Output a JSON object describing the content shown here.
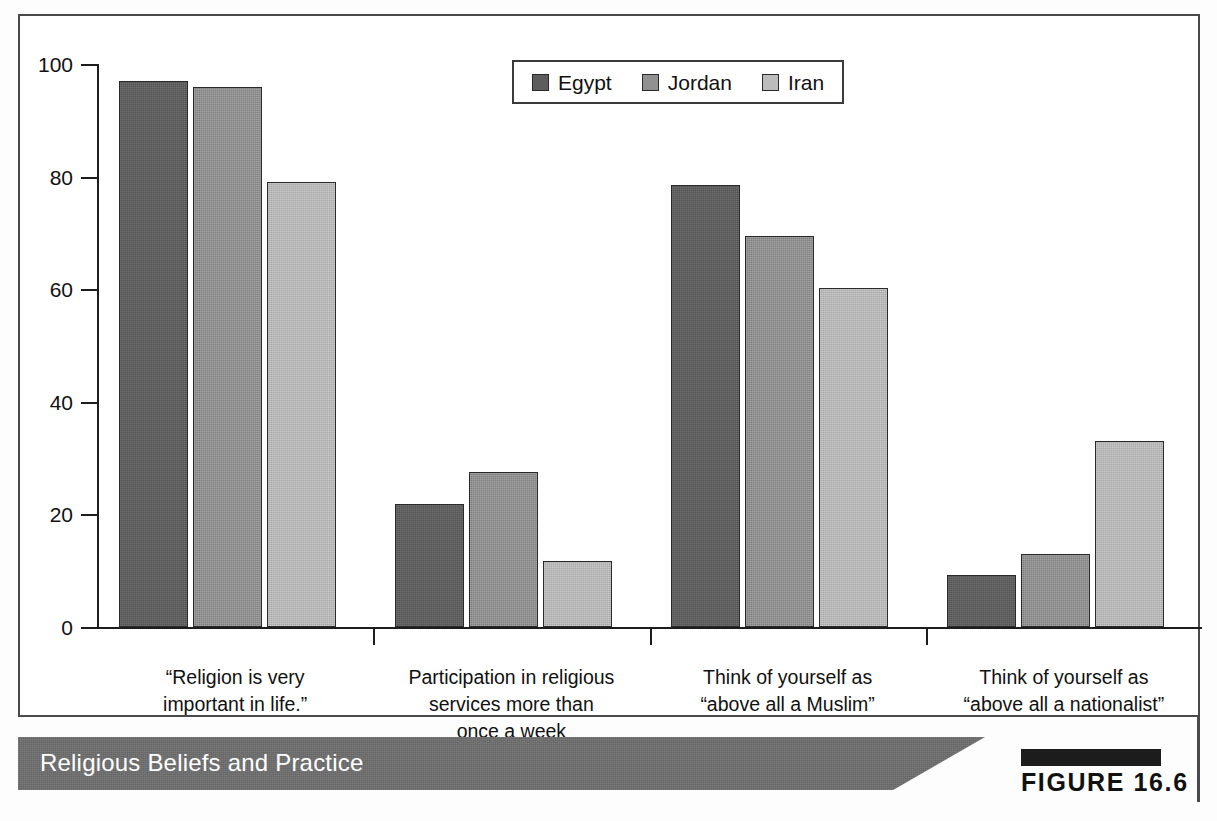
{
  "figure": {
    "banner_title": "Religious Beliefs and Practice",
    "figure_number": "FIGURE 16.6"
  },
  "chart_data": {
    "type": "bar",
    "title": "Religious Beliefs and Practice",
    "xlabel": "",
    "ylabel": "",
    "ylim": [
      0,
      100
    ],
    "yticks": [
      0,
      20,
      40,
      60,
      80,
      100
    ],
    "grid": false,
    "legend_position": "top-center",
    "categories": [
      "“Religion is very important in life.”",
      "Participation in religious services more than once a week",
      "Think of yourself as “above all a Muslim”",
      "Think of yourself as “above all a nationalist”"
    ],
    "category_lines": [
      [
        "“Religion is very",
        "important in life.”"
      ],
      [
        "Participation in religious",
        "services more than",
        "once a week"
      ],
      [
        "Think of yourself as",
        "“above all a Muslim”"
      ],
      [
        "Think of yourself as",
        "“above all a nationalist”"
      ]
    ],
    "series": [
      {
        "name": "Egypt",
        "color": "#5d5d5d",
        "values": [
          97.0,
          21.8,
          78.5,
          9.2
        ]
      },
      {
        "name": "Jordan",
        "color": "#919191",
        "values": [
          96.0,
          27.5,
          69.5,
          13.0
        ]
      },
      {
        "name": "Iran",
        "color": "#bcbcbc",
        "values": [
          79.0,
          11.8,
          60.3,
          33.0
        ]
      }
    ]
  }
}
